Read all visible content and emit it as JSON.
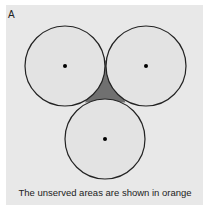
{
  "panel": {
    "label": "A",
    "caption": "The unserved areas are shown in orange"
  },
  "colors": {
    "background": "#e8e8e8",
    "circle_fill": "#e3e3e3",
    "circle_stroke": "#222222",
    "unserved_fill": "#707070",
    "dot": "#000000"
  },
  "circles": [
    {
      "name": "left",
      "cx": 65,
      "cy": 66,
      "r": 40
    },
    {
      "name": "right",
      "cx": 146,
      "cy": 66,
      "r": 40
    },
    {
      "name": "bottom",
      "cx": 105,
      "cy": 139,
      "r": 40
    }
  ]
}
